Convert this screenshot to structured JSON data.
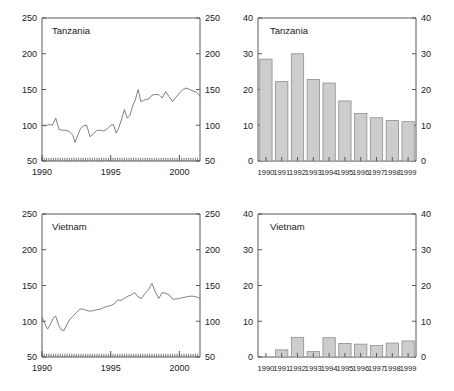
{
  "figure": {
    "title": "",
    "panels_note": "2x2 grid of country panels: left column monthly index line charts, right column annual bar charts"
  },
  "chart_data": [
    {
      "id": "tanzania-line",
      "type": "line",
      "title": "Tanzania",
      "xlabel": "",
      "ylabel": "",
      "xlim": [
        1990,
        2001.5
      ],
      "ylim": [
        50,
        250
      ],
      "yticks": [
        50,
        100,
        150,
        200,
        250
      ],
      "xticks": [
        1990,
        1995,
        2000
      ],
      "xticklabels": [
        "1990",
        "1995",
        "2000"
      ],
      "yticklabels": [
        "50",
        "100",
        "150",
        "200",
        "250"
      ],
      "grid": false,
      "legend": "none",
      "minor_ticks": "monthly on bottom axis",
      "dual_axis": true,
      "x": [
        1990.0,
        1990.25,
        1990.5,
        1990.75,
        1991.0,
        1991.1,
        1991.25,
        1991.5,
        1991.75,
        1992.0,
        1992.25,
        1992.4,
        1992.6,
        1992.8,
        1993.0,
        1993.25,
        1993.5,
        1993.75,
        1994.0,
        1994.25,
        1994.5,
        1994.75,
        1995.0,
        1995.2,
        1995.4,
        1995.6,
        1995.8,
        1996.0,
        1996.2,
        1996.4,
        1996.6,
        1996.8,
        1997.0,
        1997.2,
        1997.4,
        1997.6,
        1997.8,
        1998.0,
        1998.25,
        1998.5,
        1998.75,
        1999.0,
        1999.25,
        1999.5,
        1999.75,
        2000.0,
        2000.25,
        2000.5,
        2000.75,
        2001.0,
        2001.25,
        2001.5
      ],
      "values": [
        100,
        99,
        101,
        100,
        110,
        103,
        94,
        93,
        93,
        91,
        86,
        76,
        86,
        95,
        99,
        100,
        84,
        88,
        93,
        93,
        92,
        95,
        100,
        101,
        89,
        97,
        109,
        122,
        110,
        114,
        127,
        136,
        150,
        133,
        135,
        136,
        137,
        142,
        143,
        143,
        138,
        147,
        140,
        133,
        139,
        145,
        150,
        152,
        150,
        148,
        146,
        141
      ]
    },
    {
      "id": "tanzania-bars",
      "type": "bar",
      "title": "Tanzania",
      "xlabel": "",
      "ylabel": "",
      "ylim": [
        0,
        40
      ],
      "yticks": [
        0,
        10,
        20,
        30,
        40
      ],
      "yticklabels": [
        "0",
        "10",
        "20",
        "30",
        "40"
      ],
      "categories": [
        "1990",
        "1991",
        "1992",
        "1993",
        "1994",
        "1995",
        "1996",
        "1997",
        "1998",
        "1999"
      ],
      "values": [
        28.5,
        22.2,
        30.0,
        22.8,
        21.8,
        16.8,
        13.3,
        12.1,
        11.3,
        11.0
      ],
      "grid": false,
      "legend": "none",
      "dual_axis": true,
      "bar_color": "#cdcdcd",
      "bar_edge_color": "#8b8e91"
    },
    {
      "id": "vietnam-line",
      "type": "line",
      "title": "Vietnam",
      "xlabel": "",
      "ylabel": "",
      "xlim": [
        1990,
        2001.5
      ],
      "ylim": [
        50,
        250
      ],
      "yticks": [
        50,
        100,
        150,
        200,
        250
      ],
      "xticks": [
        1990,
        1995,
        2000
      ],
      "xticklabels": [
        "1990",
        "1995",
        "2000"
      ],
      "yticklabels": [
        "50",
        "100",
        "150",
        "200",
        "250"
      ],
      "grid": false,
      "legend": "none",
      "minor_ticks": "monthly on bottom axis",
      "dual_axis": true,
      "x": [
        1990.0,
        1990.2,
        1990.4,
        1990.6,
        1990.8,
        1991.0,
        1991.2,
        1991.4,
        1991.6,
        1991.8,
        1992.0,
        1992.25,
        1992.5,
        1992.75,
        1993.0,
        1993.25,
        1993.5,
        1993.75,
        1994.0,
        1994.25,
        1994.5,
        1994.75,
        1995.0,
        1995.25,
        1995.5,
        1995.75,
        1996.0,
        1996.25,
        1996.5,
        1996.75,
        1997.0,
        1997.25,
        1997.5,
        1997.75,
        1998.0,
        1998.25,
        1998.5,
        1998.75,
        1999.0,
        1999.25,
        1999.5,
        1999.75,
        2000.0,
        2000.25,
        2000.5,
        2000.75,
        2001.0,
        2001.25,
        2001.5
      ],
      "values": [
        106,
        97,
        89,
        95,
        104,
        107,
        95,
        88,
        87,
        95,
        102,
        107,
        112,
        117,
        117,
        115,
        114,
        115,
        116,
        117,
        119,
        121,
        122,
        124,
        130,
        129,
        132,
        135,
        137,
        140,
        134,
        132,
        139,
        144,
        153,
        141,
        132,
        140,
        139,
        137,
        131,
        131,
        132,
        133,
        134,
        135,
        135,
        134,
        132
      ]
    },
    {
      "id": "vietnam-bars",
      "type": "bar",
      "title": "Vietnam",
      "xlabel": "",
      "ylabel": "",
      "ylim": [
        0,
        40
      ],
      "yticks": [
        0,
        10,
        20,
        30,
        40
      ],
      "yticklabels": [
        "0",
        "10",
        "20",
        "30",
        "40"
      ],
      "categories": [
        "1990",
        "1991",
        "1992",
        "1993",
        "1994",
        "1995",
        "1996",
        "1997",
        "1998",
        "1999"
      ],
      "values": [
        0.0,
        2.0,
        5.5,
        1.5,
        5.4,
        3.8,
        3.6,
        3.2,
        3.9,
        4.5
      ],
      "grid": false,
      "legend": "none",
      "dual_axis": true,
      "bar_color": "#cdcdcd",
      "bar_edge_color": "#8b8e91"
    }
  ]
}
